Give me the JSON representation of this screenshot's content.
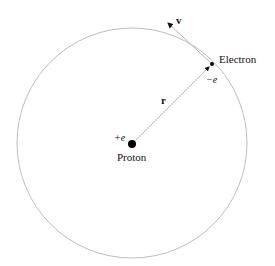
{
  "diagram": {
    "labels": {
      "electron": "Electron",
      "electron_charge": "−e",
      "proton": "Proton",
      "proton_charge": "+e",
      "radius": "r",
      "velocity": "v"
    },
    "geometry": {
      "orbit_center": [
        132,
        143
      ],
      "orbit_radius": 115,
      "proton_position": [
        132,
        144
      ],
      "electron_position": [
        212,
        64
      ],
      "velocity_tip": [
        167,
        22
      ]
    },
    "colors": {
      "orbit": "#bdbdbd",
      "radius_line": "#c8c8c8",
      "particles": "#000000",
      "text": "#111111"
    }
  }
}
